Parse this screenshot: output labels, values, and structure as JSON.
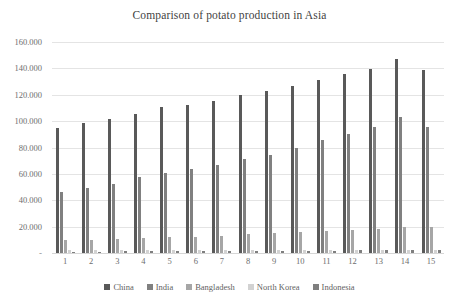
{
  "chart_data": {
    "type": "bar",
    "title": "Comparison of potato production in Asia",
    "xlabel": "",
    "ylabel": "",
    "ylim": [
      0,
      160000
    ],
    "grid": true,
    "legend_position": "bottom",
    "y_tick_labels": [
      "160.000",
      "140.000",
      "120.000",
      "100.000",
      "80.000",
      "60.000",
      "40.000",
      "20.000",
      "-"
    ],
    "y_ticks": [
      160000,
      140000,
      120000,
      100000,
      80000,
      60000,
      40000,
      20000,
      0
    ],
    "categories": [
      "1",
      "2",
      "3",
      "4",
      "5",
      "6",
      "7",
      "8",
      "9",
      "10",
      "11",
      "12",
      "13",
      "14",
      "15"
    ],
    "series": [
      {
        "name": "China",
        "color": "#595959",
        "values": [
          95000,
          98500,
          101500,
          105500,
          110500,
          112500,
          115500,
          119500,
          122500,
          126500,
          131500,
          135500,
          139500,
          147000,
          139000
        ]
      },
      {
        "name": "India",
        "color": "#808080",
        "values": [
          46000,
          49500,
          52500,
          57500,
          60500,
          63500,
          66500,
          71500,
          74500,
          79500,
          85500,
          90500,
          95500,
          103500,
          95500
        ]
      },
      {
        "name": "Bangladesh",
        "color": "#a6a6a6",
        "values": [
          9500,
          10000,
          10500,
          11500,
          12000,
          12500,
          13000,
          14500,
          15000,
          16000,
          16500,
          17500,
          18500,
          20000,
          19500
        ]
      },
      {
        "name": "North Korea",
        "color": "#d2d2d2",
        "values": [
          2000,
          2000,
          2000,
          2000,
          2000,
          2000,
          2000,
          2000,
          2000,
          2000,
          2000,
          2000,
          2000,
          2000,
          2000
        ]
      },
      {
        "name": "Indonesia",
        "color": "#7f7f7f",
        "values": [
          1000,
          1100,
          1200,
          1300,
          1400,
          1400,
          1500,
          1600,
          1700,
          1800,
          1900,
          2000,
          2100,
          2200,
          2200
        ]
      }
    ]
  }
}
